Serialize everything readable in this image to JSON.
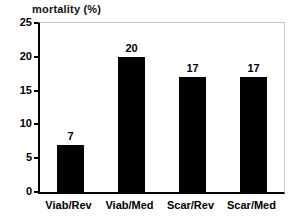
{
  "chart_data": {
    "type": "bar",
    "title": "mortality (%)",
    "xlabel": "",
    "ylabel": "",
    "categories": [
      "Viab/Rev",
      "Viab/Med",
      "Scar/Rev",
      "Scar/Med"
    ],
    "values": [
      7,
      20,
      17,
      17
    ],
    "value_labels": [
      "7",
      "20",
      "17",
      "17"
    ],
    "ylim": [
      0,
      25
    ],
    "yticks": [
      0,
      5,
      10,
      15,
      20,
      25
    ],
    "ytick_labels": [
      "0",
      "5",
      "10",
      "15",
      "20",
      "25"
    ],
    "grid": false,
    "legend": false,
    "legend_position": "none",
    "bar_color": "#000000",
    "frame_color": "#c9c9c9",
    "axis_color": "#000000",
    "background_color": "#ffffff"
  }
}
